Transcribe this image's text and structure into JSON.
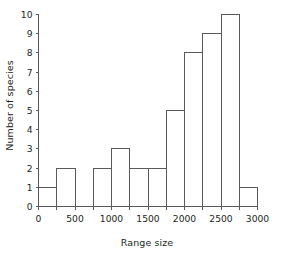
{
  "chart_data": {
    "type": "bar",
    "title": "",
    "xlabel": "Range size",
    "ylabel": "Number of species",
    "categories": [
      "0-250",
      "250-500",
      "500-750",
      "750-1000",
      "1000-1250",
      "1250-1500",
      "1500-1750",
      "1750-2000",
      "2000-2250",
      "2250-2500",
      "2500-2750",
      "2750-3000"
    ],
    "bin_edges": [
      0,
      250,
      500,
      750,
      1000,
      1250,
      1500,
      1750,
      2000,
      2250,
      2500,
      2750,
      3000
    ],
    "values": [
      1,
      2,
      0,
      2,
      3,
      2,
      2,
      5,
      8,
      9,
      10,
      1
    ],
    "bin_width": 250,
    "xlim": [
      0,
      3000
    ],
    "ylim": [
      0,
      10
    ],
    "xticks": [
      0,
      250,
      500,
      750,
      1000,
      1250,
      1500,
      1750,
      2000,
      2250,
      2500,
      2750,
      3000
    ],
    "xtick_labels": [
      "0",
      "",
      "500",
      "",
      "1000",
      "",
      "1500",
      "",
      "2000",
      "",
      "2500",
      "",
      "3000"
    ],
    "yticks": [
      0,
      1,
      2,
      3,
      4,
      5,
      6,
      7,
      8,
      9,
      10
    ],
    "ytick_labels": [
      "0",
      "1",
      "2",
      "3",
      "4",
      "5",
      "6",
      "7",
      "8",
      "9",
      "10"
    ],
    "grid": false,
    "legend": null,
    "bar_fill_color": "#ffffff",
    "bar_edge_color": "#58595b",
    "axis_color": "#58595b",
    "text_color": "#231f20",
    "background_color": "#ffffff"
  }
}
